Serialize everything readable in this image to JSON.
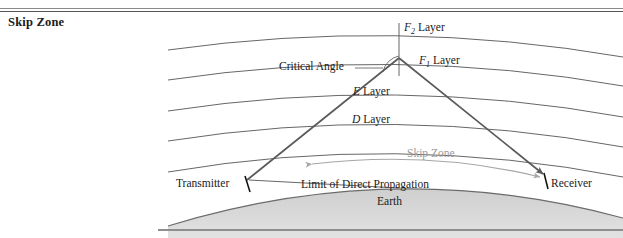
{
  "figure": {
    "title": "Skip Zone"
  },
  "diagram": {
    "type": "skip-zone-ionospheric-propagation",
    "labels": {
      "f2_layer": "Layer",
      "f2_symbol": "F",
      "f2_subscript": "2",
      "f1_layer": "Layer",
      "f1_symbol": "F",
      "f1_subscript": "1",
      "e_layer": "Layer",
      "e_symbol": "E",
      "d_layer": "Layer",
      "d_symbol": "D",
      "critical_angle": "Critical Angle",
      "skip_zone": "Skip Zone",
      "transmitter": "Transmitter",
      "receiver": "Receiver",
      "limit_of_direct_propagation": "Limit of Direct Propagation",
      "earth": "Earth"
    },
    "colors": {
      "line": "#555555",
      "ray": "#5a5a5a",
      "skip_zone_arrow": "#a6a6a6",
      "skip_zone_text": "#9a9a9a",
      "earth_fill": "#d8d8d8",
      "earth_edge": "#6b6b6b",
      "rule": "#8a8a8a",
      "text": "#1a1a1a"
    }
  }
}
